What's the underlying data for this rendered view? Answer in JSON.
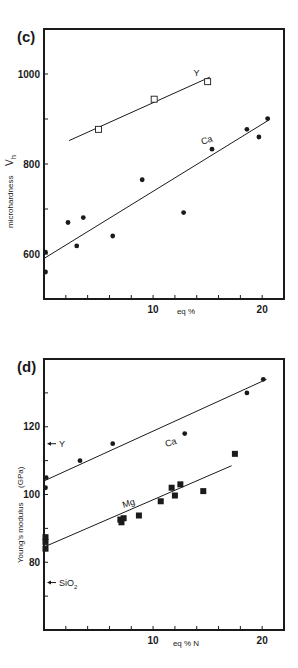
{
  "chart_data": [
    {
      "panel": "(c)",
      "type": "scatter",
      "title": "",
      "xlabel": "eq %",
      "ylabel": "microhardness V_h",
      "ylabel_main": "microhardness",
      "ylabel_symbol": "V",
      "ylabel_sub": "h",
      "xlim": [
        0,
        22
      ],
      "ylim": [
        500,
        1100
      ],
      "xticks": [
        0,
        2,
        4,
        6,
        8,
        10,
        12,
        14,
        16,
        18,
        20
      ],
      "xtick_labels": [
        {
          "value": 10,
          "label": "10"
        },
        {
          "value": 20,
          "label": "20"
        }
      ],
      "yticks": [
        600,
        700,
        800,
        900,
        1000
      ],
      "ytick_labels": [
        {
          "value": 600,
          "label": "600"
        },
        {
          "value": 800,
          "label": "800"
        },
        {
          "value": 1000,
          "label": "1000"
        }
      ],
      "grid": false,
      "series": [
        {
          "name": "Y",
          "marker": "open-square",
          "label_pos": [
            13.7,
            996
          ],
          "points": [
            [
              5.0,
              877
            ],
            [
              10.1,
              944
            ],
            [
              15.0,
              983
            ]
          ],
          "fit": [
            [
              2.3,
              852
            ],
            [
              15.2,
              993
            ]
          ]
        },
        {
          "name": "Ca",
          "marker": "filled-circle",
          "label_pos": [
            14.5,
            843
          ],
          "points": [
            [
              0,
              604
            ],
            [
              0,
              560
            ],
            [
              2.2,
              670
            ],
            [
              3.0,
              618
            ],
            [
              3.6,
              681
            ],
            [
              6.3,
              640
            ],
            [
              9.0,
              765
            ],
            [
              12.8,
              692
            ],
            [
              15.4,
              833
            ],
            [
              18.6,
              877
            ],
            [
              19.7,
              860
            ],
            [
              20.5,
              901
            ]
          ],
          "fit": [
            [
              0,
              590
            ],
            [
              20.7,
              899
            ]
          ]
        }
      ],
      "annotations": []
    },
    {
      "panel": "(d)",
      "type": "scatter",
      "title": "",
      "xlabel": "eq % N",
      "ylabel": "Young's modulus (GPa)",
      "ylabel_main": "Young's  modulus",
      "ylabel_unit": "(GPa)",
      "xlim": [
        0,
        22
      ],
      "ylim": [
        60,
        140
      ],
      "xticks": [
        0,
        2,
        4,
        6,
        8,
        10,
        12,
        14,
        16,
        18,
        20
      ],
      "xtick_labels": [
        {
          "value": 10,
          "label": "10"
        },
        {
          "value": 20,
          "label": "20"
        }
      ],
      "yticks": [
        70,
        80,
        90,
        100,
        110,
        120,
        130
      ],
      "ytick_labels": [
        {
          "value": 80,
          "label": "80"
        },
        {
          "value": 100,
          "label": "100"
        },
        {
          "value": 120,
          "label": "120"
        }
      ],
      "grid": false,
      "series": [
        {
          "name": "Ca",
          "marker": "filled-circle",
          "label_pos": [
            11.2,
            114
          ],
          "points": [
            [
              0.2,
              105
            ],
            [
              0.1,
              102
            ],
            [
              3.3,
              110
            ],
            [
              6.3,
              115
            ],
            [
              12.9,
              118
            ],
            [
              18.6,
              130
            ],
            [
              20.1,
              134
            ]
          ],
          "fit": [
            [
              0,
              104
            ],
            [
              20.4,
              134
            ]
          ]
        },
        {
          "name": "Mg",
          "marker": "filled-square",
          "label_pos": [
            7.3,
            96
          ],
          "points": [
            [
              0,
              87.4
            ],
            [
              0,
              86
            ],
            [
              0,
              84
            ],
            [
              7.0,
              92.6
            ],
            [
              7.1,
              91.8
            ],
            [
              7.3,
              93
            ],
            [
              8.7,
              93.8
            ],
            [
              10.7,
              98
            ],
            [
              11.7,
              102
            ],
            [
              12.0,
              99.7
            ],
            [
              12.5,
              103
            ],
            [
              14.6,
              101
            ],
            [
              17.5,
              112
            ]
          ],
          "fit": [
            [
              0,
              84.5
            ],
            [
              17.2,
              108.5
            ]
          ]
        }
      ],
      "annotations": [
        {
          "text": "Y",
          "value": 115,
          "kind": "arrow-left"
        },
        {
          "text": "SiO2",
          "main": "SiO",
          "sub": "2",
          "value": 74,
          "kind": "arrow-left"
        }
      ]
    }
  ],
  "panels": {
    "c": {
      "label": "(c)"
    },
    "d": {
      "label": "(d)"
    }
  },
  "colors": {
    "ink": "#1a1a1a",
    "background": "#ffffff"
  }
}
